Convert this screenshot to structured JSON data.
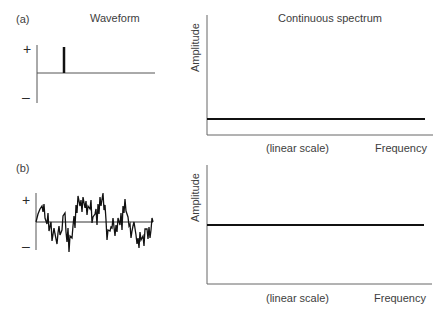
{
  "panels": [
    {
      "id": "a",
      "label": "(a)",
      "waveform_title": "Waveform",
      "plus": "+",
      "minus": "–",
      "spectrum_title": "Continuous spectrum",
      "ylabel": "Amplitude",
      "xscale": "(linear scale)",
      "xlabel": "Frequency",
      "waveform_type": "impulse",
      "spectrum_type": "flat-low"
    },
    {
      "id": "b",
      "label": "(b)",
      "plus": "+",
      "minus": "–",
      "ylabel": "Amplitude",
      "xscale": "(linear scale)",
      "xlabel": "Frequency",
      "waveform_type": "random-noise",
      "spectrum_type": "flat-high"
    }
  ],
  "colors": {
    "axis": "#555555",
    "trace": "#1a1a1a"
  }
}
